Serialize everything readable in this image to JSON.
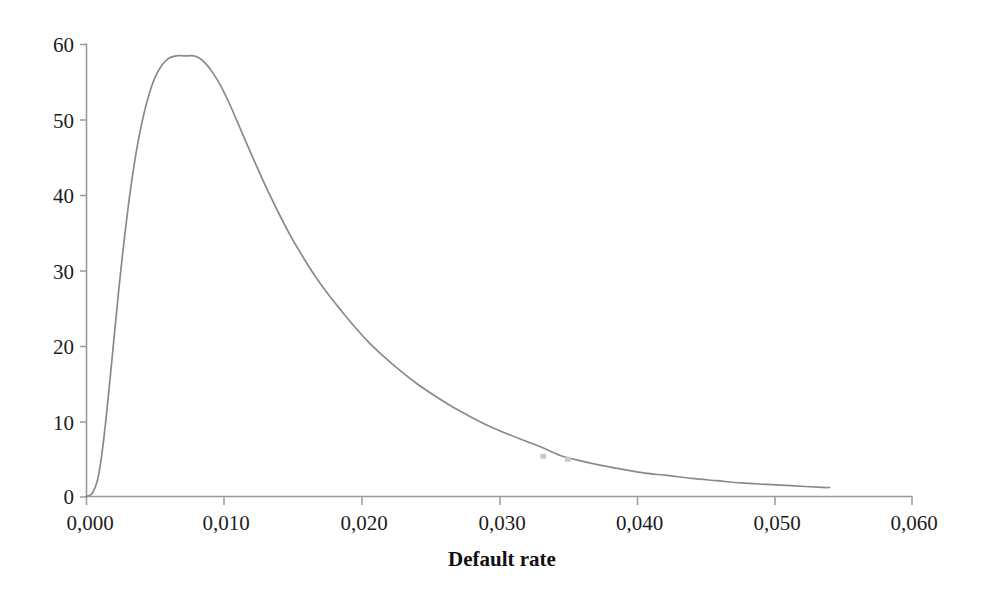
{
  "figure": {
    "background_color": "#ffffff",
    "curve_color": "#8a8a8a",
    "axis_color": "#9a9a9a",
    "text_color": "#1c1c1c"
  },
  "chart_data": {
    "type": "line",
    "title": "",
    "subtitle": "",
    "xlabel": "Default rate",
    "ylabel": "",
    "xlim": [
      0.0,
      0.06
    ],
    "ylim": [
      0,
      60
    ],
    "grid": false,
    "legend": null,
    "legend_position": "none",
    "xticks": [
      0.0,
      0.01,
      0.02,
      0.03,
      0.04,
      0.05,
      0.06
    ],
    "xtick_labels": [
      "0,000",
      "0,010",
      "0,020",
      "0,030",
      "0,040",
      "0,050",
      "0,060"
    ],
    "yticks": [
      0,
      10,
      20,
      30,
      40,
      50,
      60
    ],
    "ytick_labels": [
      "0",
      "10",
      "20",
      "30",
      "40",
      "50",
      "60"
    ],
    "decimal_separator": ",",
    "peak": {
      "x": 0.0078,
      "y": 58.5
    },
    "curve_x_end": 0.054,
    "series": [
      {
        "name": "Default rate density",
        "x": [
          0.0,
          0.0004,
          0.0008,
          0.0011,
          0.0014,
          0.0017,
          0.002,
          0.0023,
          0.0026,
          0.003,
          0.0034,
          0.0038,
          0.0042,
          0.0046,
          0.005,
          0.0055,
          0.006,
          0.0065,
          0.007,
          0.0074,
          0.0078,
          0.0082,
          0.0087,
          0.0092,
          0.0097,
          0.0103,
          0.011,
          0.0117,
          0.0124,
          0.0132,
          0.014,
          0.0148,
          0.0157,
          0.0166,
          0.0175,
          0.0185,
          0.0195,
          0.0205,
          0.0216,
          0.0228,
          0.024,
          0.0252,
          0.0265,
          0.0278,
          0.0292,
          0.0306,
          0.032,
          0.033,
          0.0345,
          0.036,
          0.0375,
          0.039,
          0.0406,
          0.0422,
          0.044,
          0.0458,
          0.0476,
          0.0495,
          0.0515,
          0.0535,
          0.054
        ],
        "y": [
          0.0,
          0.4,
          2.2,
          5.4,
          10.0,
          15.4,
          21.0,
          26.6,
          31.8,
          38.0,
          43.3,
          47.6,
          51.0,
          53.7,
          55.7,
          57.3,
          58.2,
          58.5,
          58.5,
          58.5,
          58.5,
          58.2,
          57.4,
          56.2,
          54.7,
          52.5,
          49.6,
          46.6,
          43.7,
          40.5,
          37.5,
          34.7,
          31.9,
          29.3,
          27.0,
          24.7,
          22.5,
          20.5,
          18.6,
          16.7,
          15.0,
          13.5,
          12.0,
          10.7,
          9.4,
          8.3,
          7.3,
          6.6,
          5.4,
          4.7,
          4.1,
          3.6,
          3.1,
          2.8,
          2.4,
          2.1,
          1.8,
          1.6,
          1.4,
          1.2,
          1.2
        ]
      }
    ],
    "artifacts": [
      {
        "name": "scan-blot-1",
        "x": 0.0332,
        "y": 5.4
      },
      {
        "name": "scan-blot-2",
        "x": 0.035,
        "y": 5.0
      }
    ]
  }
}
